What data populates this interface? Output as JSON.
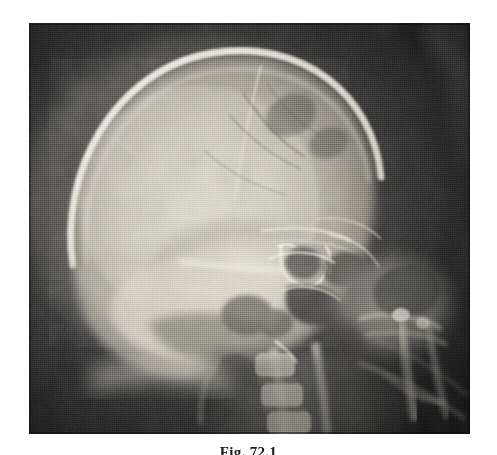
{
  "figure": {
    "caption": "Fig. 72.1",
    "caption_visibility": "top-clipped",
    "modality": "radiograph",
    "view": "lateral skull"
  },
  "plate": {
    "x": 29,
    "y": 23,
    "width": 441,
    "height": 411,
    "background_color": "#121212",
    "rendering": "halftone-dithered grayscale scan"
  },
  "palette": {
    "page_background": "#ffffff",
    "plate_background": "#121212",
    "bone_bright": "#f2efe8",
    "bone_mid": "#b9b4aa",
    "soft_tissue": "#6e6b65",
    "air_dark": "#171717",
    "caption_ink": "#1a1a1a"
  },
  "anatomy_labels": [
    "cranial-vault",
    "frontal-bone",
    "coronal-suture",
    "vascular-groove",
    "orbital-roof",
    "sella-turcica",
    "sphenoid-sinus",
    "petrous-ridge",
    "mastoid-air-cells",
    "maxilla",
    "mandible",
    "cervical-spine",
    "occipital-bone",
    "soft-tissue-neck"
  ]
}
